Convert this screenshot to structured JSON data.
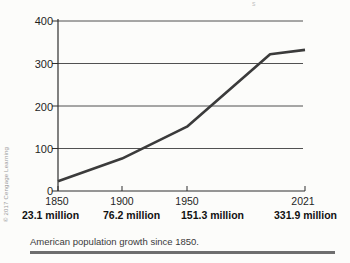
{
  "figure": {
    "caption": "American population growth since 1850.",
    "credit": "© 2017 Cengage Learning",
    "stray_mark": "s"
  },
  "chart_data": {
    "type": "line",
    "title": "",
    "xlabel": "",
    "ylabel": "",
    "x_ticks": [
      1850,
      1900,
      1950,
      2021
    ],
    "x_tick_labels": [
      "1850",
      "1900",
      "1950",
      "2021"
    ],
    "value_labels": [
      "23.1 million",
      "76.2 million",
      "151.3 million",
      "331.9 million"
    ],
    "categories": [
      1850,
      1900,
      1950,
      2021
    ],
    "values": [
      23.1,
      76.2,
      151.3,
      331.9
    ],
    "series_points": [
      [
        1850,
        23.1
      ],
      [
        1900,
        76.2
      ],
      [
        1950,
        151.3
      ],
      [
        2000,
        322
      ],
      [
        2021,
        331.9
      ]
    ],
    "y_ticks": [
      400,
      300,
      200,
      100,
      0
    ],
    "ylim": [
      0,
      400
    ],
    "grid": "horizontal",
    "legend": "none"
  },
  "colors": {
    "background": "#fcfcfa",
    "data_line": "#3b3b3b",
    "gridline": "#3d3d3d",
    "axis": "#2e2e2e",
    "tick_label_text": "#1f1f1f",
    "caption_text": "#3a3a3a",
    "credit_text": "#9a9a9a",
    "divider_bar": "#6e6e6e"
  }
}
